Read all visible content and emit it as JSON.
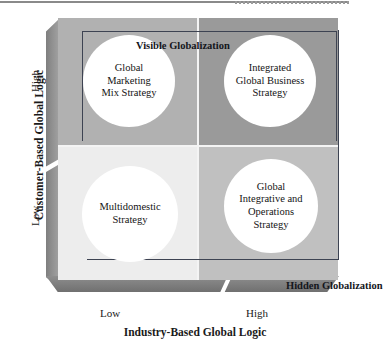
{
  "figure": {
    "y_axis": {
      "title": "Customer-Based Global Logic",
      "ticks": {
        "high": "High",
        "low": "Low"
      }
    },
    "x_axis": {
      "title": "Industry-Based Global Logic",
      "ticks": {
        "low": "Low",
        "high": "High"
      }
    },
    "bands": {
      "visible": "Visible Globalization",
      "hidden": "Hidden Globalization"
    },
    "quadrants": [
      {
        "key": "top-left",
        "label": "Global\nMarketing\nMix Strategy",
        "lines": [
          "Global",
          "Marketing",
          "Mix Strategy"
        ],
        "fill": "#b1b1b1",
        "x": "Low",
        "y": "High"
      },
      {
        "key": "top-right",
        "label": "Integrated\nGlobal Business\nStrategy",
        "lines": [
          "Integrated",
          "Global Business",
          "Strategy"
        ],
        "fill": "#9a9a9a",
        "x": "High",
        "y": "High"
      },
      {
        "key": "bottom-left",
        "label": "Multidomestic\nStrategy",
        "lines": [
          "Multidomestic",
          "Strategy"
        ],
        "fill": "#ededed",
        "x": "Low",
        "y": "Low"
      },
      {
        "key": "bottom-right",
        "label": "Global\nIntegrative and\nOperations\nStrategy",
        "lines": [
          "Global",
          "Integrative and",
          "Operations",
          "Strategy"
        ],
        "fill": "#c0c0c0",
        "x": "High",
        "y": "Low"
      }
    ],
    "colors": {
      "bevel_dark": "#7c7c7c",
      "frame_line": "#3d4352",
      "circle_fill": "#ffffff",
      "text": "#141414"
    }
  }
}
